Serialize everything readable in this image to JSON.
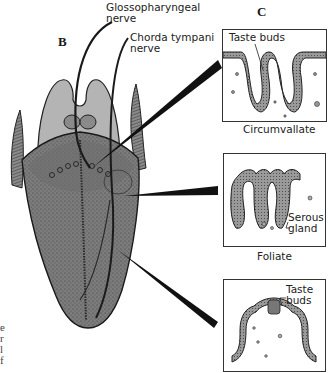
{
  "figure": {
    "panel_b_label": "B",
    "panel_c_label": "C",
    "nerves": [
      {
        "label_line1": "Glossopharyngeal",
        "label_line2": "nerve"
      },
      {
        "label_line1": "Chorda tympani",
        "label_line2": "nerve"
      }
    ],
    "papillae": [
      {
        "name": "Circumvallate",
        "annotation": "Taste buds"
      },
      {
        "name": "Foliate",
        "annotation_line1": "Serous",
        "annotation_line2": "gland"
      },
      {
        "name": "",
        "annotation_line1": "Taste",
        "annotation_line2": "buds"
      }
    ],
    "left_edge_fragments": [
      "e",
      "r",
      "l",
      "f"
    ],
    "colors": {
      "tongue_body": "#7a7a7a",
      "epiglottis": "#b4b4b4",
      "outline": "#222222",
      "papilla_tissue": "#8c8c8c"
    }
  }
}
